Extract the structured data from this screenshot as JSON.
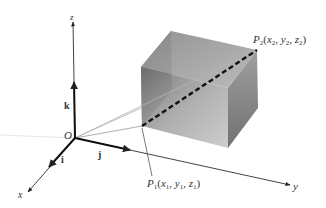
{
  "diagram": {
    "type": "3d-coordinate-system-with-box",
    "origin": {
      "label": "O",
      "pos": [
        75,
        138
      ]
    },
    "axes": {
      "x": {
        "label": "x",
        "from": [
          75,
          138
        ],
        "to": [
          28,
          192
        ],
        "label_pos": [
          19,
          196
        ]
      },
      "y": {
        "label": "y",
        "from": [
          75,
          138
        ],
        "to": [
          290,
          185
        ],
        "label_pos": [
          293,
          189
        ]
      },
      "z": {
        "label": "z",
        "from": [
          75,
          138
        ],
        "to": [
          73,
          22
        ],
        "label_pos": [
          70,
          19
        ]
      }
    },
    "unit_vectors": {
      "i": {
        "label": "i",
        "to": [
          49,
          167
        ],
        "label_pos": [
          60,
          158
        ]
      },
      "j": {
        "label": "j",
        "to": [
          130,
          150
        ],
        "label_pos": [
          99,
          155
        ]
      },
      "k": {
        "label": "k",
        "to": [
          74,
          82
        ],
        "label_pos": [
          65,
          106
        ]
      }
    },
    "box": {
      "corners": {
        "back_top_left": [
          171,
          31
        ],
        "back_top_right": [
          257,
          50
        ],
        "front_top_left": [
          141,
          67
        ],
        "front_top_right": [
          228,
          88
        ],
        "front_bottom_left": [
          142,
          126
        ],
        "front_bottom_right": [
          228,
          148
        ],
        "back_bottom_right": [
          258,
          108
        ]
      },
      "colors": {
        "top": "#9a9a9a",
        "front": "#8c8c8c",
        "right": "#6f6f6f",
        "left_back": "#5a5a5a"
      }
    },
    "points": {
      "P1": {
        "name": "P",
        "sub": "1",
        "coords": "(x₁, y₁, z₁)",
        "x": "x",
        "x_sub": "1",
        "y": "y",
        "y_sub": "1",
        "z": "z",
        "z_sub": "1",
        "label_pos": [
          147,
          182
        ],
        "pos": [
          142,
          126
        ]
      },
      "P2": {
        "name": "P",
        "sub": "2",
        "coords": "(x₂, y₂, z₂)",
        "x": "x",
        "x_sub": "2",
        "y": "y",
        "y_sub": "2",
        "z": "z",
        "z_sub": "2",
        "label_pos": [
          253,
          38
        ],
        "pos": [
          257,
          50
        ]
      }
    },
    "labels": {
      "origin": "O",
      "x_axis": "x",
      "y_axis": "y",
      "z_axis": "z",
      "i": "i",
      "j": "j",
      "k": "k",
      "p1_name": "P",
      "p1_sub": "1",
      "p2_name": "P",
      "p2_sub": "2",
      "open_paren": "(",
      "close_paren": ")",
      "comma": ",",
      "x": "x",
      "y": "y",
      "z": "z",
      "sub1": "1",
      "sub2": "2"
    },
    "dashed_segment": {
      "from": "P1",
      "to": "P2",
      "style": "dashed",
      "color": "#111111"
    }
  }
}
